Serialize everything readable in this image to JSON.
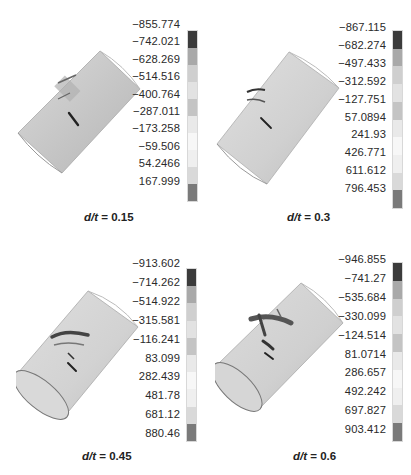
{
  "figure": {
    "panels": [
      {
        "caption_var": "d/t",
        "caption_eq": " = ",
        "caption_value": "0.15",
        "legend": [
          "−855.774",
          "−742.021",
          "−628.269",
          "−514.516",
          "−400.764",
          "−287.011",
          "−173.258",
          "−59.506",
          "54.2466",
          "167.999"
        ]
      },
      {
        "caption_var": "d/t",
        "caption_eq": " = ",
        "caption_value": "0.3",
        "legend": [
          "−867.115",
          "−682.274",
          "−497.433",
          "−312.592",
          "−127.751",
          "57.0894",
          "241.93",
          "426.771",
          "611.612",
          "796.453"
        ]
      },
      {
        "caption_var": "d/t",
        "caption_eq": " = ",
        "caption_value": "0.45",
        "legend": [
          "−913.602",
          "−714.262",
          "−514.922",
          "−315.581",
          "−116.241",
          "83.099",
          "282.439",
          "481.78",
          "681.12",
          "880.46"
        ]
      },
      {
        "caption_var": "d/t",
        "caption_eq": " = ",
        "caption_value": "0.6",
        "legend": [
          "−946.855",
          "−741.27",
          "−535.684",
          "−330.099",
          "−124.514",
          "81.0714",
          "286.657",
          "492.242",
          "697.827",
          "903.412"
        ]
      }
    ],
    "legend_band_colors": [
      "#3b3b3b",
      "#a9a9a9",
      "#cfcfcf",
      "#e2e2e2",
      "#c4c4c4",
      "#e9e9e9",
      "#f7f7f7",
      "#efefef",
      "#d9d9d9",
      "#7a7a7a"
    ],
    "pipe_color": "#c9c9c9"
  }
}
